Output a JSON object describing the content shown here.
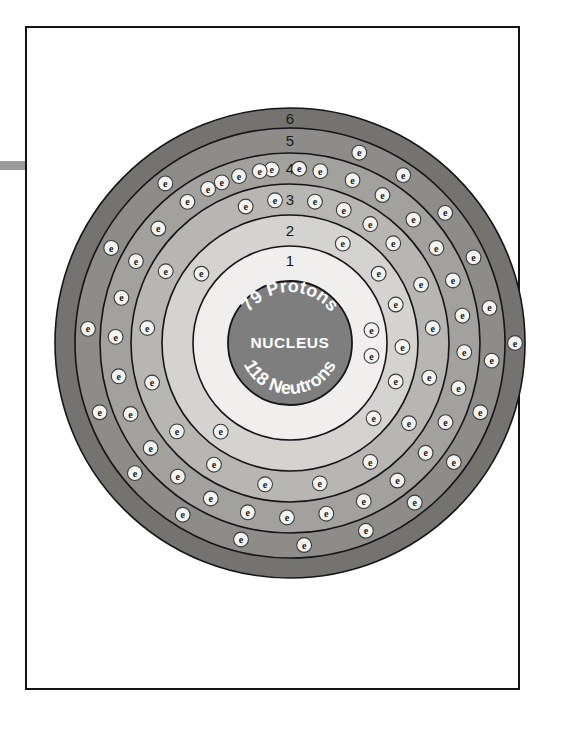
{
  "page": {
    "background_color": "#ffffff",
    "frame_border_color": "#141414",
    "margin_tab_color": "#9a9a9a"
  },
  "nucleus": {
    "label": "NUCLEUS",
    "protons_text": "79 Protons",
    "neutrons_text": "118 Neutrons",
    "protons": 79,
    "neutrons": 118,
    "fill_color": "#7e7e7e",
    "text_color": "#ffffff",
    "radius": 62
  },
  "electron": {
    "glyph": "e",
    "fill_color": "#f4f4f2",
    "stroke_color": "#3b3b3b",
    "glyph_color": "#17171a",
    "radius": 7.4
  },
  "chart_data": {
    "type": "diagram",
    "element": "Gold",
    "atomic_number": 79,
    "mass_number": 197,
    "electron_configuration_label": "2, 8, 18, 32, 18, 1",
    "total_electrons": 79,
    "center_x": 290,
    "center_y": 343,
    "shells": [
      {
        "number": "1",
        "electrons": 2,
        "inner_radius": 68,
        "outer_radius": 97,
        "band_color": "#f0efed",
        "label_angle_deg": -90,
        "electron_angles_deg": [
          -9,
          9
        ]
      },
      {
        "number": "2",
        "electrons": 8,
        "inner_radius": 97,
        "outer_radius": 128,
        "band_color": "#d4d3d0",
        "label_angle_deg": -90,
        "electron_angles_deg": [
          -62,
          -38,
          -20,
          2,
          20,
          42,
          128,
          218
        ]
      },
      {
        "number": "3",
        "electrons": 18,
        "inner_radius": 128,
        "outer_radius": 159,
        "band_color": "#b7b6b3",
        "label_angle_deg": -90,
        "electron_angles_deg": [
          -108,
          -96,
          -80,
          -68,
          -56,
          -44,
          -24,
          -6,
          14,
          34,
          56,
          78,
          100,
          122,
          142,
          164,
          186,
          210
        ]
      },
      {
        "number": "4",
        "electrons": 32,
        "inner_radius": 159,
        "outer_radius": 190,
        "band_color": "#a2a19e",
        "label_angle_deg": -90,
        "electron_angles_deg": [
          -118,
          -107,
          -96,
          -80,
          -69,
          -58,
          -45,
          -33,
          -21,
          -9,
          3,
          15,
          27,
          39,
          52,
          65,
          78,
          91,
          104,
          117,
          130,
          143,
          156,
          169,
          182,
          195,
          208,
          221,
          234,
          247,
          260,
          273
        ]
      },
      {
        "number": "5",
        "electrons": 18,
        "inner_radius": 190,
        "outer_radius": 215,
        "band_color": "#8d8c89",
        "label_angle_deg": -90,
        "electron_angles_deg": [
          -70,
          -56,
          -40,
          -25,
          -10,
          5,
          20,
          36,
          52,
          68,
          86,
          104,
          122,
          140,
          160,
          184,
          208,
          232
        ]
      },
      {
        "number": "6",
        "electrons": 1,
        "inner_radius": 215,
        "outer_radius": 235,
        "band_color": "#74736f",
        "label_angle_deg": -90,
        "electron_angles_deg": [
          0
        ]
      }
    ]
  }
}
